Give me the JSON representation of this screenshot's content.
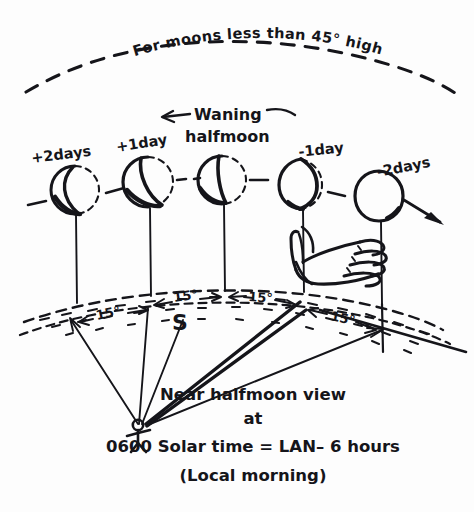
{
  "figure": {
    "title": "For moons less than 45° high",
    "direction_label": "Waning",
    "phase_label": "halfmoon",
    "south_marker": "S",
    "arrow_left": "←",
    "arrow_dash_right": "—"
  },
  "moons": [
    {
      "id": "plus-2-days",
      "label": "+2days",
      "phase": "crescent",
      "cx": 75,
      "cy": 190,
      "r": 24
    },
    {
      "id": "plus-1-day",
      "label": "+1day",
      "phase": "wide-crescent",
      "cx": 148,
      "cy": 182,
      "r": 25
    },
    {
      "id": "halfmoon",
      "label": "",
      "phase": "half",
      "cx": 222,
      "cy": 180,
      "r": 24
    },
    {
      "id": "minus-1-day",
      "label": "-1day",
      "phase": "gibbous",
      "cx": 301,
      "cy": 184,
      "r": 25
    },
    {
      "id": "minus-2-days",
      "label": "-2days",
      "phase": "near-full",
      "cx": 379,
      "cy": 196,
      "r": 25
    }
  ],
  "angles": [
    {
      "id": "gap-1",
      "label": "15°"
    },
    {
      "id": "gap-2",
      "label": "15°"
    },
    {
      "id": "gap-3",
      "label": "15°"
    },
    {
      "id": "gap-4",
      "label": "15°"
    }
  ],
  "caption": {
    "line1": "Near halfmoon view",
    "line2": "at",
    "line3": "0600 Solar time = LAN– 6 hours",
    "line4": "(Local morning)"
  },
  "colors": {
    "ink": "#15151a",
    "paper": "#fdfdfd"
  }
}
